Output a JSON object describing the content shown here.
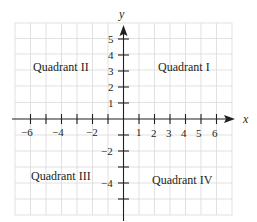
{
  "diagram": {
    "type": "coordinate-plane",
    "axes": {
      "x_label": "x",
      "y_label": "y",
      "x_range": [
        -7,
        7
      ],
      "y_range": [
        -5,
        6
      ]
    },
    "x_tick_labels": [
      {
        "value": -6,
        "text": "−6"
      },
      {
        "value": -4,
        "text": "−4"
      },
      {
        "value": -2,
        "text": "−2"
      },
      {
        "value": 1,
        "text": "1"
      },
      {
        "value": 2,
        "text": "2"
      },
      {
        "value": 3,
        "text": "3"
      },
      {
        "value": 4,
        "text": "4"
      },
      {
        "value": 5,
        "text": "5"
      },
      {
        "value": 6,
        "text": "6"
      }
    ],
    "y_tick_labels": [
      {
        "value": 5,
        "text": "5"
      },
      {
        "value": 4,
        "text": "4"
      },
      {
        "value": 3,
        "text": "3"
      },
      {
        "value": 2,
        "text": "2"
      },
      {
        "value": 1,
        "text": "1"
      },
      {
        "value": -2,
        "text": "−2"
      },
      {
        "value": -4,
        "text": "−4"
      }
    ],
    "quadrants": {
      "q1": "Quadrant I",
      "q2": "Quadrant II",
      "q3": "Quadrant III",
      "q4": "Quadrant IV"
    },
    "colors": {
      "grid": "#d9d9d9",
      "axis": "#231f20",
      "text": "#231f20"
    }
  }
}
